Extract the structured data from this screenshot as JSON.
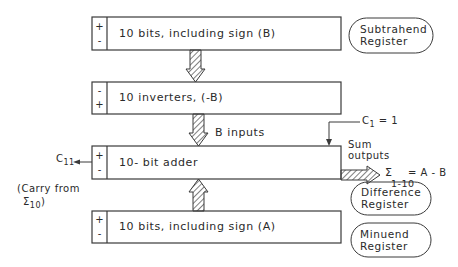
{
  "diagram": {
    "registers": [
      {
        "id": "subtrahend",
        "label": "10 bits, including sign (B)",
        "sign_top": "+",
        "sign_bottom": "-",
        "oval_line1": "Subtrahend",
        "oval_line2": "Register"
      },
      {
        "id": "inverters",
        "label": "10 inverters, (-B)",
        "sign_top": "-",
        "sign_bottom": "+"
      },
      {
        "id": "adder",
        "label": "10- bit  adder",
        "sign_top": "+",
        "sign_bottom": "-",
        "oval_line1": "Difference",
        "oval_line2": "Register"
      },
      {
        "id": "minuend",
        "label": "10 bits, including sign (A)",
        "sign_top": "+",
        "sign_bottom": "-",
        "oval_line1": "Minuend",
        "oval_line2": "Register"
      }
    ],
    "annotations": {
      "b_inputs": "B inputs",
      "carry_in_symbol": "C",
      "carry_in_sub": "1",
      "carry_in_value": "= 1",
      "carry_out_symbol": "C",
      "carry_out_sub": "11",
      "carry_note_line1": "(Carry from",
      "carry_note_sigma": "Σ",
      "carry_note_sub": "10",
      "carry_note_close": ")",
      "sum_outputs_line1": "Sum",
      "sum_outputs_line2": "outputs",
      "sum_symbol": "Σ",
      "sum_range": "1-10",
      "sum_result": "= A - B"
    },
    "colors": {
      "line": "#3a3a3a",
      "background": "#ffffff"
    }
  }
}
